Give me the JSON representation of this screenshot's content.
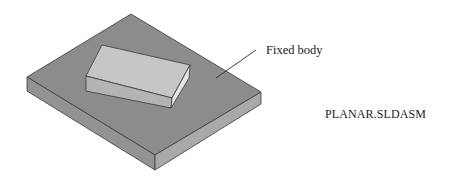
{
  "figure": {
    "callout_label": "Fixed body",
    "assembly_name": "PLANAR.SLDASM"
  },
  "colors": {
    "background": "#ffffff",
    "plate_top": "#8c8c8c",
    "plate_left_side": "#939393",
    "plate_right_side": "#a9a9a9",
    "block_top": "#c6c6c6",
    "block_front": "#b4b4b4",
    "block_right": "#e4e4e4",
    "edge": "#3a3a3a",
    "text": "#222222"
  }
}
